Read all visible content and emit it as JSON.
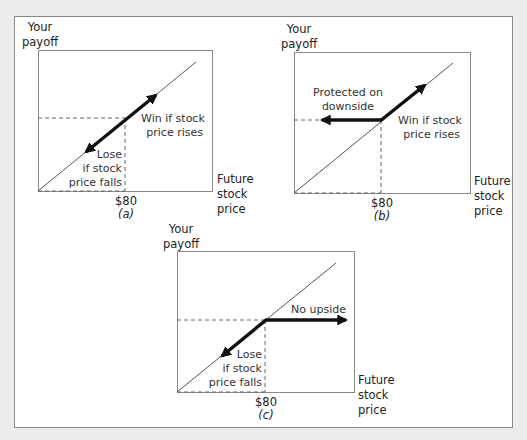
{
  "colors": {
    "background": "#ececec",
    "panel": "#ffffff",
    "frame_border": "#8a8a8a",
    "axis_box": "#8a8a8a",
    "payoff_line": "#555555",
    "dashed": "#666666",
    "arrow": "#111111",
    "text": "#333333"
  },
  "panels": [
    {
      "id": "a",
      "caption": "(a)",
      "y_axis_label": [
        "Your",
        "payoff"
      ],
      "x_axis_label": [
        "Future",
        "stock",
        "price"
      ],
      "strike_label": "$80",
      "annotations": [
        {
          "lines": [
            "Win if stock",
            "price rises"
          ]
        },
        {
          "lines": [
            "Lose",
            "if stock",
            "price falls"
          ]
        }
      ],
      "description": "Owning stock: payoff rises and falls one-for-one with stock price"
    },
    {
      "id": "b",
      "caption": "(b)",
      "y_axis_label": [
        "Your",
        "payoff"
      ],
      "x_axis_label": [
        "Future",
        "stock",
        "price"
      ],
      "strike_label": "$80",
      "annotations": [
        {
          "lines": [
            "Protected on",
            "downside"
          ]
        },
        {
          "lines": [
            "Win if stock",
            "price rises"
          ]
        }
      ],
      "description": "Call option: flat below $80, rises above $80"
    },
    {
      "id": "c",
      "caption": "(c)",
      "y_axis_label": [
        "Your",
        "payoff"
      ],
      "x_axis_label": [
        "Future",
        "stock",
        "price"
      ],
      "strike_label": "$80",
      "annotations": [
        {
          "lines": [
            "No upside"
          ]
        },
        {
          "lines": [
            "Lose",
            "if stock",
            "price falls"
          ]
        }
      ],
      "description": "Capped payoff: falls below $80, flat above $80"
    }
  ]
}
